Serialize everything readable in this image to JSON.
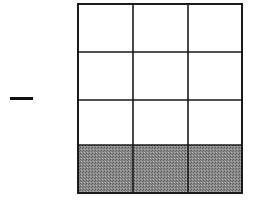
{
  "diagram": {
    "type": "fraction-grid",
    "sign": "−",
    "rows": 4,
    "cols": 3,
    "shaded_rows": [
      3
    ],
    "shaded_cells": 3,
    "total_cells": 12,
    "colors": {
      "line": "#1a1a1a",
      "shade": "#7a7a7a",
      "background": "#ffffff"
    }
  }
}
